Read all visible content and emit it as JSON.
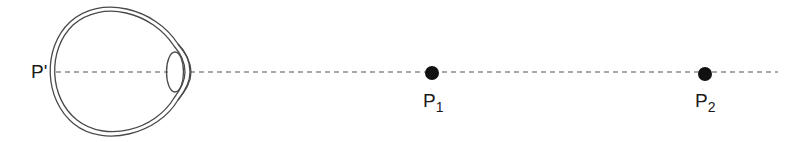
{
  "diagram": {
    "title": "",
    "labels": {
      "image_point": "P'",
      "point1_main": "P",
      "point1_sub": "1",
      "point2_main": "P",
      "point2_sub": "2"
    },
    "colors": {
      "stroke": "#4a4a4a",
      "point": "#111111",
      "background": "#ffffff"
    },
    "elements": [
      {
        "type": "eye",
        "description": "cross-section of eyeball with lens"
      },
      {
        "type": "optical-axis",
        "style": "dashed"
      },
      {
        "type": "point",
        "label": "P1"
      },
      {
        "type": "point",
        "label": "P2"
      },
      {
        "type": "image-point",
        "label": "P'"
      }
    ]
  }
}
